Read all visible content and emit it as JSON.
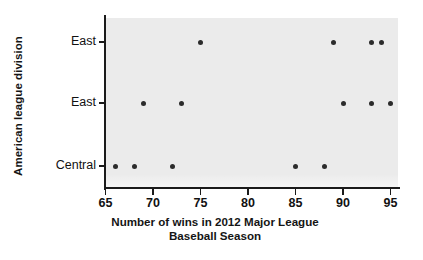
{
  "chart_data": {
    "type": "scatter",
    "title": "",
    "xlabel": "Number of wins in 2012 Major League Baseball Season",
    "ylabel": "American league division",
    "xlabel_line1": "Number of wins in 2012 Major League",
    "xlabel_line2": "Baseball Season",
    "xlim": [
      65,
      96
    ],
    "xticks": [
      65,
      70,
      75,
      80,
      85,
      90,
      95
    ],
    "xtick_labels": [
      "65",
      "70",
      "75",
      "80",
      "85",
      "90",
      "95"
    ],
    "ycategories": [
      "Central",
      "East",
      "East"
    ],
    "ytick_labels": [
      "East",
      "East",
      "Central"
    ],
    "grid": false,
    "legend": "none",
    "panel_color": "#ebebeb",
    "point_color": "#2b2b2b",
    "axis_color": "#1b1b1b",
    "points": [
      {
        "x": 75,
        "category": "East",
        "row": 2
      },
      {
        "x": 89,
        "category": "East",
        "row": 2
      },
      {
        "x": 93,
        "category": "East",
        "row": 2
      },
      {
        "x": 94,
        "category": "East",
        "row": 2
      },
      {
        "x": 69,
        "category": "East",
        "row": 1
      },
      {
        "x": 73,
        "category": "East",
        "row": 1
      },
      {
        "x": 90,
        "category": "East",
        "row": 1
      },
      {
        "x": 93,
        "category": "East",
        "row": 1
      },
      {
        "x": 95,
        "category": "East",
        "row": 1
      },
      {
        "x": 66,
        "category": "Central",
        "row": 0
      },
      {
        "x": 68,
        "category": "Central",
        "row": 0
      },
      {
        "x": 72,
        "category": "Central",
        "row": 0
      },
      {
        "x": 85,
        "category": "Central",
        "row": 0
      },
      {
        "x": 88,
        "category": "Central",
        "row": 0
      }
    ]
  }
}
